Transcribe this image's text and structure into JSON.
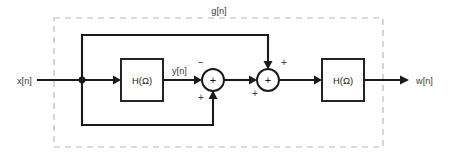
{
  "diagram": {
    "type": "signal-flow-block-diagram",
    "title": "",
    "boundary": {
      "label": "g[n]",
      "style": "dashed",
      "x": 54,
      "y": 18,
      "width": 329,
      "height": 129
    },
    "signals": {
      "input": "x[n]",
      "intermediate": "y[n]",
      "output": "w[n]",
      "enclosed_system": "g[n]"
    },
    "blocks": [
      {
        "id": "h1",
        "label": "H(Ω)",
        "x": 121,
        "y": 59,
        "width": 42,
        "height": 42
      },
      {
        "id": "h2",
        "label": "H(Ω)",
        "x": 322,
        "y": 59,
        "width": 42,
        "height": 42
      }
    ],
    "adders": [
      {
        "id": "sum1",
        "glyph": "+",
        "cx": 213,
        "cy": 80,
        "r": 11,
        "signs": [
          {
            "text": "−",
            "position": "top-left",
            "x": 201,
            "y": 64
          },
          {
            "text": "+",
            "position": "bottom-left",
            "x": 201,
            "y": 101
          }
        ]
      },
      {
        "id": "sum2",
        "glyph": "+",
        "cx": 268,
        "cy": 80,
        "r": 11,
        "signs": [
          {
            "text": "+",
            "position": "top-right",
            "x": 283,
            "y": 64
          },
          {
            "text": "+",
            "position": "bottom-left",
            "x": 255,
            "y": 97
          }
        ]
      }
    ],
    "nodes": [
      {
        "id": "split",
        "x": 82,
        "y": 80,
        "type": "junction-dot"
      }
    ],
    "labels": {
      "x_in": {
        "text": "x[n]",
        "x": 17,
        "y": 83
      },
      "y_mid": {
        "text": "y[n]",
        "x": 172,
        "y": 74
      },
      "w_out": {
        "text": "w[n]",
        "x": 416,
        "y": 83
      },
      "g_top": {
        "text": "g[n]",
        "x": 219,
        "y": 11
      }
    }
  }
}
